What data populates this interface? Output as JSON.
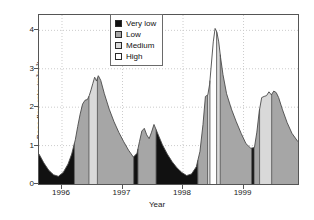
{
  "chart_data": {
    "type": "area",
    "title": "",
    "xlabel": "Year",
    "ylabel": "Base flow rate (m³s⁻¹)",
    "ylim": [
      0,
      4.4
    ],
    "xlim": [
      1995.62,
      1999.9
    ],
    "yticks": [
      0,
      1,
      2,
      3,
      4
    ],
    "ytick_labels": [
      "0",
      "1",
      "2",
      "3",
      "4"
    ],
    "xticks": [
      1996,
      1997,
      1998,
      1999
    ],
    "xtick_labels": [
      "1996",
      "1997",
      "1998",
      "1999"
    ],
    "grid": "dotted light grey, horizontal at 1,2,3,4 and vertical at year ticks",
    "legend_position": "top-center-left, inside axes",
    "legend": [
      {
        "label": "Very low",
        "color": "#111111"
      },
      {
        "label": "Low",
        "color": "#a6a6a6"
      },
      {
        "label": "Medium",
        "color": "#d9d9d9"
      },
      {
        "label": "High",
        "color": "#ffffff"
      }
    ],
    "series": [
      {
        "name": "Base flow rate",
        "x": [
          1995.62,
          1995.7,
          1995.78,
          1995.86,
          1995.94,
          1996.02,
          1996.1,
          1996.16,
          1996.22,
          1996.26,
          1996.3,
          1996.34,
          1996.38,
          1996.42,
          1996.45,
          1996.48,
          1996.51,
          1996.54,
          1996.57,
          1996.6,
          1996.64,
          1996.7,
          1996.78,
          1996.86,
          1996.94,
          1997.02,
          1997.1,
          1997.18,
          1997.24,
          1997.28,
          1997.32,
          1997.36,
          1997.4,
          1997.44,
          1997.48,
          1997.52,
          1997.58,
          1997.66,
          1997.74,
          1997.82,
          1997.9,
          1997.98,
          1998.06,
          1998.14,
          1998.22,
          1998.28,
          1998.33,
          1998.37,
          1998.41,
          1998.44,
          1998.47,
          1998.5,
          1998.53,
          1998.56,
          1998.59,
          1998.62,
          1998.66,
          1998.72,
          1998.8,
          1998.88,
          1998.96,
          1999.04,
          1999.12,
          1999.18,
          1999.22,
          1999.26,
          1999.3,
          1999.34,
          1999.38,
          1999.42,
          1999.46,
          1999.5,
          1999.54,
          1999.58,
          1999.64,
          1999.72,
          1999.8,
          1999.9
        ],
        "y": [
          0.78,
          0.55,
          0.36,
          0.24,
          0.2,
          0.3,
          0.52,
          0.78,
          1.15,
          1.5,
          1.82,
          2.08,
          2.18,
          2.2,
          2.3,
          2.45,
          2.62,
          2.78,
          2.68,
          2.82,
          2.7,
          2.35,
          1.95,
          1.62,
          1.34,
          1.1,
          0.88,
          0.7,
          0.8,
          1.1,
          1.38,
          1.45,
          1.28,
          1.18,
          1.35,
          1.55,
          1.32,
          1.02,
          0.78,
          0.58,
          0.42,
          0.3,
          0.22,
          0.26,
          0.45,
          0.85,
          1.55,
          2.28,
          2.32,
          2.6,
          3.15,
          3.7,
          4.05,
          3.95,
          3.7,
          3.3,
          2.85,
          2.35,
          1.95,
          1.62,
          1.32,
          1.05,
          0.93,
          0.95,
          1.35,
          1.9,
          2.25,
          2.28,
          2.3,
          2.4,
          2.32,
          2.42,
          2.38,
          2.25,
          1.95,
          1.6,
          1.32,
          1.1
        ],
        "note": "daily base flow hydrograph; fill colour encodes flow class"
      }
    ],
    "class_bands": [
      {
        "class": "Very low",
        "from": 1995.62,
        "to": 1996.205
      },
      {
        "class": "Low",
        "from": 1996.205,
        "to": 1996.445
      },
      {
        "class": "Medium",
        "from": 1996.445,
        "to": 1996.585
      },
      {
        "class": "Low",
        "from": 1996.585,
        "to": 1997.185
      },
      {
        "class": "Very low",
        "from": 1997.185,
        "to": 1997.255
      },
      {
        "class": "Low",
        "from": 1997.255,
        "to": 1997.555
      },
      {
        "class": "Very low",
        "from": 1997.555,
        "to": 1998.245
      },
      {
        "class": "Low",
        "from": 1998.245,
        "to": 1998.405
      },
      {
        "class": "Medium",
        "from": 1998.405,
        "to": 1998.445
      },
      {
        "class": "High",
        "from": 1998.445,
        "to": 1998.555
      },
      {
        "class": "Medium",
        "from": 1998.555,
        "to": 1998.615
      },
      {
        "class": "Low",
        "from": 1998.615,
        "to": 1999.135
      },
      {
        "class": "Very low",
        "from": 1999.135,
        "to": 1999.175
      },
      {
        "class": "Low",
        "from": 1999.175,
        "to": 1999.265
      },
      {
        "class": "Medium",
        "from": 1999.265,
        "to": 1999.465
      },
      {
        "class": "Low",
        "from": 1999.465,
        "to": 1999.9
      }
    ],
    "annotations": [
      {
        "text": "peak 1996 ≈ 2.8 m³s⁻¹",
        "x": 1996.6,
        "y": 2.82
      },
      {
        "text": "twin peaks 1997 ≈ 1.45 / 1.55 m³s⁻¹",
        "x": 1997.52,
        "y": 1.55
      },
      {
        "text": "peak 1998 ≈ 4.05 m³s⁻¹",
        "x": 1998.53,
        "y": 4.05
      },
      {
        "text": "peak 1999 ≈ 2.4 m³s⁻¹",
        "x": 1999.5,
        "y": 2.42
      }
    ],
    "colors": {
      "very_low": "#111111",
      "low": "#a6a6a6",
      "medium": "#d9d9d9",
      "high": "#ffffff",
      "outline": "#4a4a4a",
      "axis": "#555555",
      "grid": "#cccccc",
      "text": "#1a1a1a"
    }
  }
}
